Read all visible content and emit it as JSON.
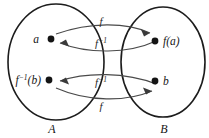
{
  "diagram": {
    "type": "function-inverse-mapping",
    "sets": {
      "domain": {
        "label": "A",
        "name": "set-a"
      },
      "codomain": {
        "label": "B",
        "name": "set-b"
      }
    },
    "points": {
      "a": {
        "label": "a",
        "set": "A"
      },
      "fa": {
        "label": "f(a)",
        "set": "B"
      },
      "finv_b": {
        "label_base": "f",
        "label_sup": "−1",
        "label_tail": "(b)",
        "label": "f−1(b)",
        "set": "A"
      },
      "b": {
        "label": "b",
        "set": "B"
      }
    },
    "arrows": [
      {
        "name": "arrow-f-top",
        "from": "a",
        "to": "fa",
        "label_base": "f",
        "label_sup": "",
        "direction": "A-to-B"
      },
      {
        "name": "arrow-finv-top",
        "from": "fa",
        "to": "a",
        "label_base": "f",
        "label_sup": "−1",
        "direction": "B-to-A"
      },
      {
        "name": "arrow-finv-bottom",
        "from": "b",
        "to": "finv_b",
        "label_base": "f",
        "label_sup": "−1",
        "direction": "B-to-A"
      },
      {
        "name": "arrow-f-bottom",
        "from": "finv_b",
        "to": "b",
        "label_base": "f",
        "label_sup": "",
        "direction": "A-to-B"
      }
    ],
    "labels": {
      "f": "f",
      "f_inverse_base": "f",
      "f_inverse_sup": "−1",
      "point_a": "a",
      "point_fa": "f(a)",
      "point_b": "b",
      "point_finv_b_base": "f",
      "point_finv_b_sup": "−1",
      "point_finv_b_tail": "(b)",
      "set_a": "A",
      "set_b": "B"
    },
    "colors": {
      "ellipse_stroke": "#1c1c1c",
      "arrow_stroke": "#4a4a4a",
      "dot_fill": "#141414",
      "text": "#161616",
      "background": "#ffffff"
    }
  }
}
